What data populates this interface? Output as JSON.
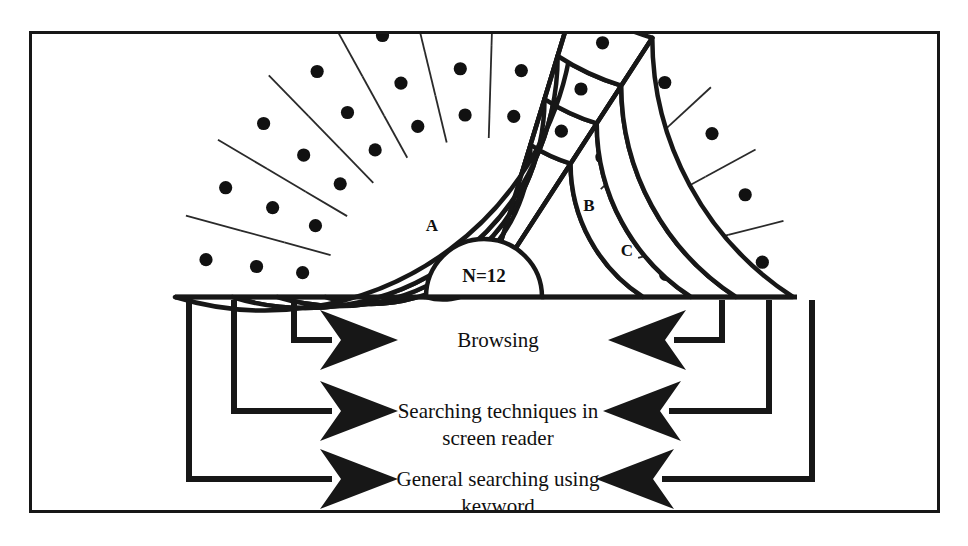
{
  "figure": {
    "type": "nested-semicircle-sunburst",
    "center_label": "N=12",
    "sector_labels": {
      "a": "A",
      "b": "B",
      "c": "C"
    }
  },
  "colors": {
    "stroke": "#171717",
    "thin_stroke": "#2a2a2a",
    "dot": "#111111",
    "background": "#ffffff",
    "frame": "#171717"
  },
  "geometry": {
    "center_x": 484,
    "center_y": 297,
    "radius_inner": 58,
    "ring_radii": [
      159,
      207,
      252,
      309
    ],
    "sectors": [
      {
        "id": "a",
        "label": "A",
        "start_deg": 180,
        "end_deg": 73,
        "ring_cells": [
          7,
          7,
          7
        ],
        "dots_per_cell": 1
      },
      {
        "id": "b",
        "label": "B",
        "start_deg": 73,
        "end_deg": 57,
        "ring_cells": [
          1,
          1,
          1
        ],
        "dots_per_cell": 1
      },
      {
        "id": "c",
        "label": "C",
        "start_deg": 57,
        "end_deg": 0,
        "ring_cells": [
          4,
          4,
          4
        ],
        "dots_per_cell": 1
      }
    ],
    "ring_to_category": [
      "Browsing",
      "Searching techniques in screen reader",
      "General searching using keyword"
    ]
  },
  "legend": {
    "rows": [
      {
        "id": "browsing",
        "line1": "Browsing",
        "line2": ""
      },
      {
        "id": "searching-techniques",
        "line1": "Searching techniques in",
        "line2": "screen reader"
      },
      {
        "id": "general-searching",
        "line1": "General searching using",
        "line2": "keyword"
      }
    ]
  },
  "chart_data": {
    "type": "pie",
    "title": "",
    "total_label": "N=12",
    "total": 12,
    "categories": [
      "Browsing",
      "Searching techniques in screen reader",
      "General searching using keyword"
    ],
    "groups": [
      "A",
      "B",
      "C"
    ],
    "series": [
      {
        "name": "Browsing",
        "ring": 1,
        "values": [
          7,
          1,
          4
        ]
      },
      {
        "name": "Searching techniques in screen reader",
        "ring": 2,
        "values": [
          7,
          1,
          4
        ]
      },
      {
        "name": "General searching using keyword",
        "ring": 3,
        "values": [
          7,
          1,
          4
        ]
      }
    ],
    "legend_position": "bottom",
    "grid": false
  }
}
